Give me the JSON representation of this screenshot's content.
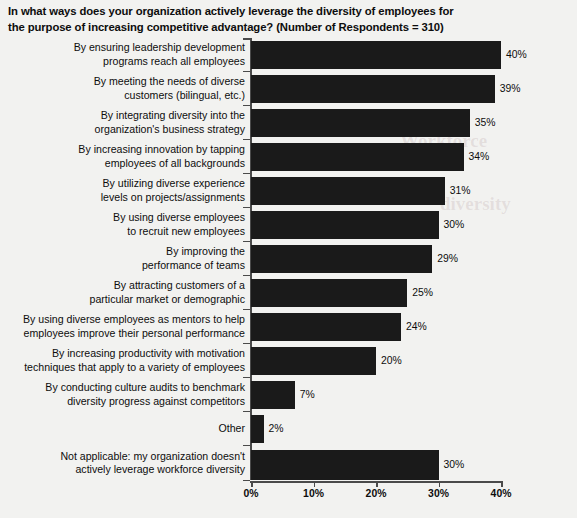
{
  "chart_data": {
    "type": "bar",
    "orientation": "horizontal",
    "title": "In what ways does your organization actively leverage the diversity of employees for the purpose of increasing competitive advantage? (Number of Respondents = 310)",
    "xlabel": "",
    "ylabel": "",
    "xlim": [
      0,
      40
    ],
    "grid": false,
    "legend": false,
    "respondents": 310,
    "bar_color": "#1a1a1a",
    "background_color": "#f2f2f0",
    "axis_color": "#4a4a4a",
    "x_ticks": [
      "0%",
      "10%",
      "20%",
      "30%",
      "40%"
    ],
    "x_tick_values": [
      0,
      10,
      20,
      30,
      40
    ],
    "categories": [
      "By ensuring leadership development\nprograms reach all employees",
      "By meeting the needs of diverse\ncustomers (bilingual, etc.)",
      "By integrating diversity into the\norganization's business strategy",
      "By increasing innovation by tapping\nemployees of all backgrounds",
      "By utilizing diverse experience\nlevels on projects/assignments",
      "By using diverse employees\nto recruit new employees",
      "By improving the\nperformance of teams",
      "By attracting customers of a\nparticular market or demographic",
      "By using diverse employees as mentors to help\nemployees improve their personal performance",
      "By increasing productivity with motivation\ntechniques that apply to a variety of employees",
      "By conducting culture audits to benchmark\ndiversity progress against competitors",
      "Other",
      "Not applicable: my organization doesn't\nactively leverage workforce diversity"
    ],
    "values": [
      40,
      39,
      35,
      34,
      31,
      30,
      29,
      25,
      24,
      20,
      7,
      2,
      30
    ],
    "value_labels": [
      "40%",
      "39%",
      "35%",
      "34%",
      "31%",
      "30%",
      "29%",
      "25%",
      "24%",
      "20%",
      "7%",
      "2%",
      "30%"
    ]
  },
  "ghost_text": {
    "line1": "Workforce Diversity",
    "line2": "diversity"
  }
}
